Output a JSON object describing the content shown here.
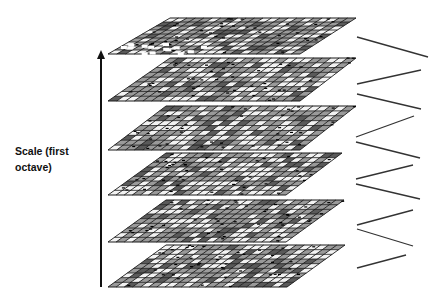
{
  "diagram": {
    "type": "scale-space-octave-stack",
    "axis_label": {
      "line1": "Scale (first",
      "line2": "octave)"
    },
    "axis": {
      "direction": "up",
      "x": 101,
      "y_bottom": 287,
      "y_top": 50
    },
    "layer_count": 6,
    "layers": [
      {
        "index": 1,
        "top_y": 18,
        "bottom_y": 54,
        "top_x0": 170,
        "top_x1": 356,
        "bot_x0": 108,
        "bot_x1": 300,
        "ragged": true
      },
      {
        "index": 2,
        "top_y": 58,
        "bottom_y": 101,
        "top_x0": 170,
        "top_x1": 356,
        "bot_x0": 108,
        "bot_x1": 300,
        "ragged": false
      },
      {
        "index": 3,
        "top_y": 106,
        "bottom_y": 150,
        "top_x0": 166,
        "top_x1": 356,
        "bot_x0": 108,
        "bot_x1": 300,
        "ragged": false
      },
      {
        "index": 4,
        "top_y": 153,
        "bottom_y": 195,
        "top_x0": 166,
        "top_x1": 342,
        "bot_x0": 108,
        "bot_x1": 286,
        "ragged": false
      },
      {
        "index": 5,
        "top_y": 200,
        "bottom_y": 242,
        "top_x0": 166,
        "top_x1": 344,
        "bot_x0": 108,
        "bot_x1": 286,
        "ragged": false
      },
      {
        "index": 6,
        "top_y": 245,
        "bottom_y": 287,
        "top_x0": 166,
        "top_x1": 345,
        "bot_x0": 108,
        "bot_x1": 287,
        "ragged": false
      }
    ],
    "zigzag_segments": [
      [
        357,
        37,
        428,
        57
      ],
      [
        357,
        84,
        421,
        70
      ],
      [
        357,
        94,
        421,
        109
      ],
      [
        356,
        137,
        414,
        116
      ],
      [
        356,
        142,
        420,
        158
      ],
      [
        356,
        179,
        413,
        165
      ],
      [
        356,
        184,
        420,
        199
      ],
      [
        357,
        225,
        413,
        210
      ],
      [
        357,
        229,
        413,
        246
      ],
      [
        357,
        268,
        406,
        255
      ]
    ],
    "colors": {
      "background": "#ffffff",
      "grid_line": "#1a1a1a",
      "cell_fill": "#9a9a9a",
      "cell_light": "#f2f2f2",
      "arrow": "#111111",
      "zigzag": "#333333"
    }
  }
}
